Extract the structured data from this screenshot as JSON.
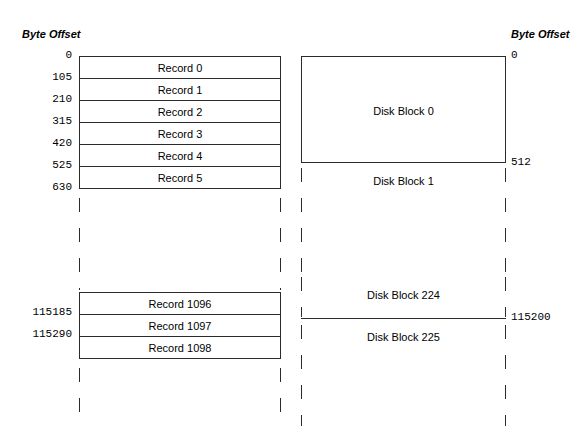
{
  "figure": {
    "left_header": "Byte Offset",
    "right_header": "Byte Offset"
  },
  "record_view": {
    "offsets_top": [
      "0",
      "105",
      "210",
      "315",
      "420",
      "525",
      "630"
    ],
    "records_top": [
      "Record 0",
      "Record 1",
      "Record 2",
      "Record 3",
      "Record 4",
      "Record 5"
    ],
    "offsets_bottom": [
      "115185",
      "115290"
    ],
    "records_bottom": [
      "Record 1096",
      "Record 1097",
      "Record 1098"
    ]
  },
  "block_view": {
    "block0_label": "Disk Block 0",
    "block1_label": "Disk Block 1",
    "block224_label": "Disk Block 224",
    "block225_label": "Disk Block 225",
    "offset_0": "0",
    "offset_512": "512",
    "offset_115200": "115200"
  },
  "colors": {
    "stroke": "#2b2b2b",
    "background": "#ffffff",
    "text": "#000000"
  }
}
